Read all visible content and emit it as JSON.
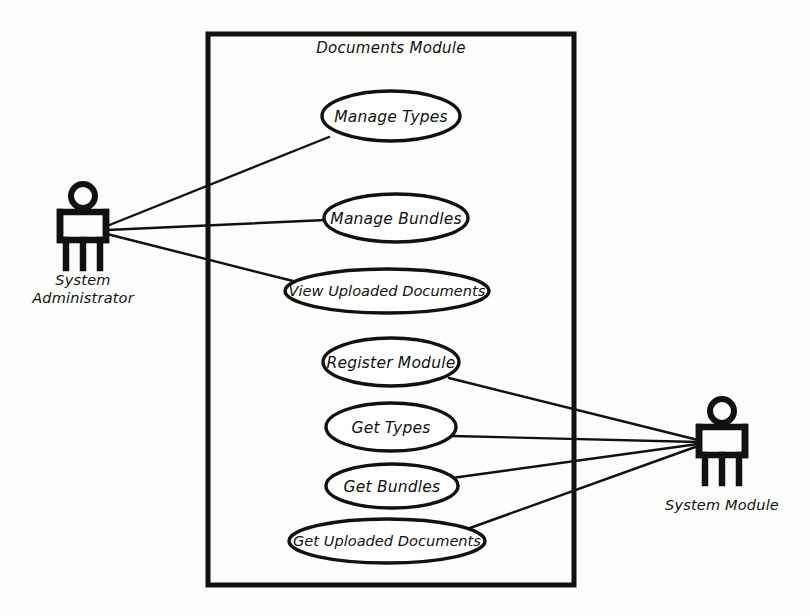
{
  "diagram": {
    "kind": "uml-use-case-diagram",
    "title": "Documents Module",
    "background_color": "#fdfdfc",
    "line_color": "#111111",
    "boundary": {
      "label": "Documents Module",
      "x": 208,
      "y": 34,
      "width": 366,
      "height": 551
    },
    "actors": [
      {
        "id": "system-administrator",
        "label_line1": "System",
        "label_line2": "Administrator",
        "full_label": "System Administrator",
        "cx": 83,
        "cy": 228,
        "label_x": 83,
        "label_y": 281
      },
      {
        "id": "system-module",
        "label_line1": "System Module",
        "label_line2": "",
        "full_label": "System Module",
        "cx": 722,
        "cy": 442,
        "label_x": 722,
        "label_y": 506
      }
    ],
    "use_cases": [
      {
        "id": "manage-types",
        "label": "Manage Types",
        "cx": 391,
        "cy": 116,
        "rx": 69,
        "ry": 25,
        "actor": "system-administrator"
      },
      {
        "id": "manage-bundles",
        "label": "Manage Bundles",
        "cx": 396,
        "cy": 218,
        "rx": 72,
        "ry": 24,
        "actor": "system-administrator"
      },
      {
        "id": "view-uploaded-documents",
        "label": "View Uploaded Documents",
        "cx": 387,
        "cy": 291,
        "rx": 102,
        "ry": 22,
        "actor": "system-administrator"
      },
      {
        "id": "register-module",
        "label": "Register Module",
        "cx": 391,
        "cy": 362,
        "rx": 68,
        "ry": 24,
        "actor": "system-module"
      },
      {
        "id": "get-types",
        "label": "Get Types",
        "cx": 391,
        "cy": 427,
        "rx": 65,
        "ry": 24,
        "actor": "system-module"
      },
      {
        "id": "get-bundles",
        "label": "Get Bundles",
        "cx": 392,
        "cy": 486,
        "rx": 66,
        "ry": 22,
        "actor": "system-module"
      },
      {
        "id": "get-uploaded-documents",
        "label": "Get Uploaded Documents",
        "cx": 387,
        "cy": 541,
        "rx": 98,
        "ry": 22,
        "actor": "system-module"
      }
    ],
    "associations": [
      {
        "id": "assoc-admin-manage-types",
        "from": "system-administrator",
        "to": "manage-types",
        "x1": 107,
        "y1": 226,
        "x2": 329,
        "y2": 137
      },
      {
        "id": "assoc-admin-manage-bundles",
        "from": "system-administrator",
        "to": "manage-bundles",
        "x1": 107,
        "y1": 230,
        "x2": 326,
        "y2": 220
      },
      {
        "id": "assoc-admin-view-uploaded-documents",
        "from": "system-administrator",
        "to": "view-uploaded-documents",
        "x1": 107,
        "y1": 234,
        "x2": 293,
        "y2": 281
      },
      {
        "id": "assoc-module-register-module",
        "from": "system-module",
        "to": "register-module",
        "x1": 698,
        "y1": 440,
        "x2": 449,
        "y2": 378
      },
      {
        "id": "assoc-module-get-types",
        "from": "system-module",
        "to": "get-types",
        "x1": 698,
        "y1": 442,
        "x2": 452,
        "y2": 436
      },
      {
        "id": "assoc-module-get-bundles",
        "from": "system-module",
        "to": "get-bundles",
        "x1": 698,
        "y1": 444,
        "x2": 452,
        "y2": 478
      },
      {
        "id": "assoc-module-get-uploaded-documents",
        "from": "system-module",
        "to": "get-uploaded-documents",
        "x1": 698,
        "y1": 446,
        "x2": 470,
        "y2": 528
      }
    ]
  }
}
